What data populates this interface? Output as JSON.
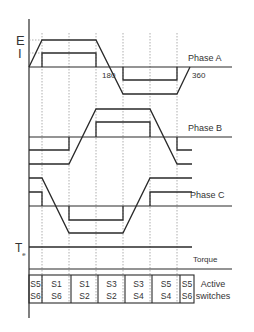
{
  "axis_labels": {
    "emf": "E",
    "current": "I",
    "torque": "Te"
  },
  "angle_labels": [
    "180",
    "360"
  ],
  "phases": [
    {
      "name": "Phase A"
    },
    {
      "name": "Phase B"
    },
    {
      "name": "Phase C"
    }
  ],
  "torque_label": "Torque",
  "switches_label_line1": "Active",
  "switches_label_line2": "switches",
  "switch_sequence": [
    {
      "top": "S5",
      "bottom": "S6"
    },
    {
      "top": "S1",
      "bottom": "S6"
    },
    {
      "top": "S1",
      "bottom": "S2"
    },
    {
      "top": "S3",
      "bottom": "S2"
    },
    {
      "top": "S3",
      "bottom": "S4"
    },
    {
      "top": "S5",
      "bottom": "S4"
    },
    {
      "top": "S5",
      "bottom": "S6"
    }
  ],
  "sector_angles_deg": [
    0,
    30,
    90,
    150,
    210,
    270,
    330,
    360
  ]
}
